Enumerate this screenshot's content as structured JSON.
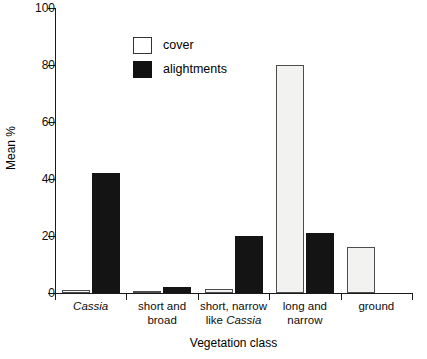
{
  "chart_data": {
    "type": "bar",
    "title": "",
    "xlabel": "Vegetation class",
    "ylabel": "Mean %",
    "ylim": [
      0,
      100
    ],
    "yticks": [
      0,
      20,
      40,
      60,
      80,
      100
    ],
    "grid": false,
    "legend_position": "top-left-inside",
    "categories": [
      "Cassia",
      "short and broad",
      "short, narrow like Cassia",
      "long and narrow",
      "ground"
    ],
    "category_lines": [
      [
        "Cassia"
      ],
      [
        "short and",
        "broad"
      ],
      [
        "short, narrow",
        "like Cassia"
      ],
      [
        "long and",
        "narrow"
      ],
      [
        "ground"
      ]
    ],
    "series": [
      {
        "name": "cover",
        "color": "#f2f2f0",
        "values": [
          1,
          0.5,
          1.5,
          80,
          16
        ]
      },
      {
        "name": "alightments",
        "color": "#141414",
        "values": [
          42,
          2,
          20,
          21,
          0
        ]
      }
    ]
  },
  "axis": {
    "y_tick_labels": [
      "0",
      "20",
      "40",
      "60",
      "80",
      "100"
    ],
    "y_title": "Mean %",
    "x_title": "Vegetation class"
  },
  "legend": {
    "items": [
      {
        "label": "cover"
      },
      {
        "label": "alightments"
      }
    ]
  }
}
